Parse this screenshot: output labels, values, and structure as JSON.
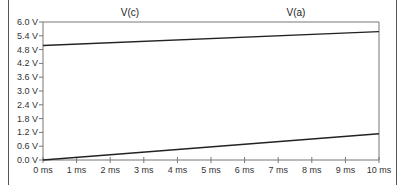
{
  "chart_data": {
    "type": "line",
    "title": "",
    "xlabel": "",
    "ylabel": "",
    "x": [
      0,
      10
    ],
    "x_unit": "ms",
    "xlim": [
      0,
      10
    ],
    "ylim": [
      0,
      6.0
    ],
    "x_ticks": [
      "0 ms",
      "1 ms",
      "2 ms",
      "3 ms",
      "4 ms",
      "5 ms",
      "6 ms",
      "7 ms",
      "8 ms",
      "9 ms",
      "10 ms"
    ],
    "y_ticks": [
      "0.0 V",
      "0.6 V",
      "1.2 V",
      "1.8 V",
      "2.4 V",
      "3.0 V",
      "3.6 V",
      "4.2 V",
      "4.8 V",
      "5.4 V",
      "6.0 V"
    ],
    "grid": false,
    "legend_position": "top (labels above plot)",
    "series": [
      {
        "name": "V(c)",
        "x": [
          0,
          10
        ],
        "values": [
          4.98,
          5.58
        ],
        "color": "#222222"
      },
      {
        "name": "V(a)",
        "x": [
          0,
          10
        ],
        "values": [
          0.0,
          1.14
        ],
        "color": "#222222"
      }
    ]
  },
  "labels": {
    "series_c": "V(c)",
    "series_a": "V(a)"
  }
}
